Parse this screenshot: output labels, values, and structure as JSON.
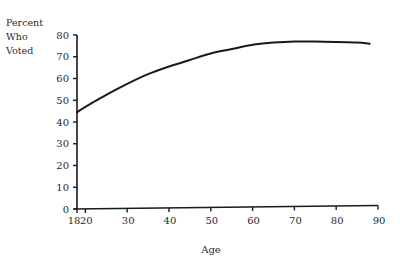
{
  "chart_data": {
    "type": "line",
    "title": "",
    "xlabel": "Age",
    "ylabel_lines": [
      "Percent",
      "Who",
      "Voted"
    ],
    "ylabel": "Percent Who Voted",
    "xlim": [
      18,
      90
    ],
    "ylim": [
      0,
      80
    ],
    "x_ticks": [
      18,
      20,
      30,
      40,
      50,
      60,
      70,
      80,
      90
    ],
    "y_ticks": [
      0,
      10,
      20,
      30,
      40,
      50,
      60,
      70,
      80
    ],
    "grid": false,
    "legend": null,
    "series": [
      {
        "name": "Percent Who Voted",
        "x": [
          18,
          20,
          25,
          30,
          35,
          40,
          45,
          50,
          55,
          60,
          65,
          70,
          75,
          80,
          85,
          88
        ],
        "y": [
          44.5,
          47,
          52.5,
          57.5,
          62,
          65.5,
          68.5,
          71.5,
          73.5,
          75.5,
          76.5,
          77,
          77,
          76.8,
          76.5,
          76
        ]
      }
    ]
  },
  "axes": {
    "x_label": "Age",
    "y_label_lines": [
      "Percent",
      "Who",
      "Voted"
    ]
  }
}
